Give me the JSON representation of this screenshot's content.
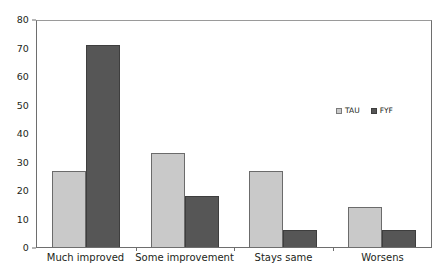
{
  "chart_data": {
    "type": "bar",
    "title": "",
    "subtitle": "",
    "xlabel": "",
    "ylabel": "",
    "categories": [
      "Much improved",
      "Some improvement",
      "Stays same",
      "Worsens"
    ],
    "series": [
      {
        "name": "TAU",
        "color": "#c9c9c9",
        "values": [
          26.5,
          33,
          26.5,
          14
        ]
      },
      {
        "name": "FYF",
        "color": "#565656",
        "values": [
          71,
          18,
          6,
          6
        ]
      }
    ],
    "ylim": [
      0,
      80
    ],
    "yticks": [
      0,
      10,
      20,
      30,
      40,
      50,
      60,
      70,
      80
    ],
    "ytick_labels": [
      "0",
      "10",
      "20",
      "30",
      "40",
      "50",
      "60",
      "70",
      "80"
    ],
    "grid": false,
    "legend_position": "center-right"
  },
  "legend": {
    "items": [
      {
        "label": "TAU",
        "swatch": "legend-swatch-tau"
      },
      {
        "label": "FYF",
        "swatch": "legend-swatch-fyf"
      }
    ]
  }
}
